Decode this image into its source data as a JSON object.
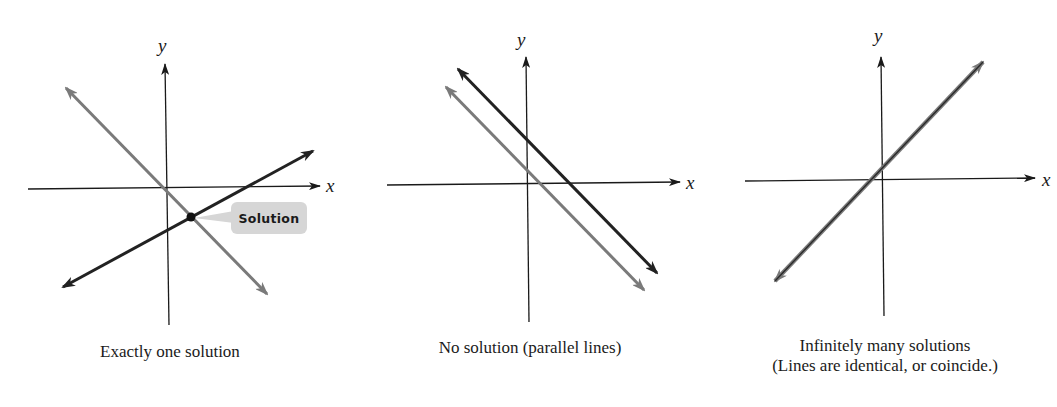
{
  "colors": {
    "axis": "#1a1a1a",
    "dark_line": "#222222",
    "gray_line": "#7a7a7a",
    "callout_fill": "#d6d6d6"
  },
  "panels": [
    {
      "id": "one-solution",
      "axis_x_label": "x",
      "axis_y_label": "y",
      "callout_label": "Solution",
      "caption_lines": [
        "Exactly one solution"
      ]
    },
    {
      "id": "no-solution",
      "axis_x_label": "x",
      "axis_y_label": "y",
      "caption_lines": [
        "No solution (parallel lines)"
      ]
    },
    {
      "id": "infinite-solutions",
      "axis_x_label": "x",
      "axis_y_label": "y",
      "caption_lines": [
        "Infinitely many solutions",
        "(Lines are identical, or coincide.)"
      ]
    }
  ]
}
